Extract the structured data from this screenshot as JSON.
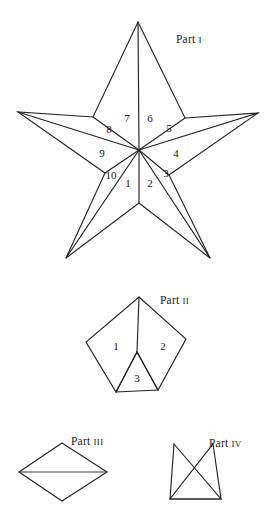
{
  "figure": {
    "width": 271,
    "height": 525,
    "background": "#ffffff",
    "stroke_color": "#242424",
    "text_color": "#151515"
  },
  "parts": [
    {
      "id": "part-1",
      "label_text": "Part",
      "label_roman": "I",
      "label_x": 176,
      "label_y": 40,
      "shape": "five-pointed-star-with-ten-wedges",
      "center": {
        "x": 139,
        "y": 150
      },
      "outer_points": [
        {
          "name": "top",
          "x": 138,
          "y": 22
        },
        {
          "name": "right",
          "x": 258,
          "y": 113
        },
        {
          "name": "bottom-right",
          "x": 210,
          "y": 258
        },
        {
          "name": "bottom-left",
          "x": 66,
          "y": 258
        },
        {
          "name": "left",
          "x": 18,
          "y": 112
        }
      ],
      "inner_points": [
        {
          "name": "upper-right",
          "x": 185,
          "y": 118
        },
        {
          "name": "lower-right",
          "x": 169,
          "y": 175
        },
        {
          "name": "bottom",
          "x": 139,
          "y": 203
        },
        {
          "name": "lower-left",
          "x": 105,
          "y": 173
        },
        {
          "name": "upper-left",
          "x": 93,
          "y": 117
        }
      ],
      "regions": [
        {
          "number": "1",
          "x": 128,
          "y": 184
        },
        {
          "number": "2",
          "x": 150,
          "y": 184
        },
        {
          "number": "3",
          "x": 166,
          "y": 174
        },
        {
          "number": "4",
          "x": 176,
          "y": 154
        },
        {
          "number": "5",
          "x": 169,
          "y": 129
        },
        {
          "number": "6",
          "x": 150,
          "y": 119
        },
        {
          "number": "7",
          "x": 127,
          "y": 119
        },
        {
          "number": "8",
          "x": 109,
          "y": 130
        },
        {
          "number": "9",
          "x": 102,
          "y": 154
        },
        {
          "number": "10",
          "x": 111,
          "y": 176
        }
      ]
    },
    {
      "id": "part-2",
      "label_text": "Part",
      "label_roman": "II",
      "label_x": 160,
      "label_y": 300,
      "shape": "pentagon-kite-with-three-regions",
      "vertices": {
        "apex": {
          "x": 139,
          "y": 297
        },
        "left": {
          "x": 86,
          "y": 342
        },
        "right": {
          "x": 186,
          "y": 339
        },
        "left_bottom": {
          "x": 116,
          "y": 392
        },
        "right_bottom": {
          "x": 158,
          "y": 390
        },
        "mid": {
          "x": 137,
          "y": 352
        }
      },
      "regions": [
        {
          "number": "1",
          "x": 116,
          "y": 347
        },
        {
          "number": "2",
          "x": 163,
          "y": 347
        },
        {
          "number": "3",
          "x": 137,
          "y": 379
        }
      ]
    },
    {
      "id": "part-3",
      "label_text": "Part",
      "label_roman": "III",
      "label_x": 75,
      "label_y": 441,
      "shape": "rhombus-with-horizontal-diagonal",
      "vertices": {
        "top": {
          "x": 62,
          "y": 443
        },
        "right": {
          "x": 107,
          "y": 472
        },
        "bottom": {
          "x": 62,
          "y": 501
        },
        "left": {
          "x": 19,
          "y": 472
        }
      }
    },
    {
      "id": "part-4",
      "label_text": "Part",
      "label_roman": "IV",
      "label_x": 214,
      "label_y": 443,
      "shape": "two-crossing-triangles",
      "vertices": {
        "left_peak": {
          "x": 174,
          "y": 444
        },
        "right_peak": {
          "x": 213,
          "y": 444
        },
        "base_left": {
          "x": 170,
          "y": 499
        },
        "base_right": {
          "x": 221,
          "y": 499
        },
        "cross": {
          "x": 194,
          "y": 478
        }
      }
    }
  ]
}
